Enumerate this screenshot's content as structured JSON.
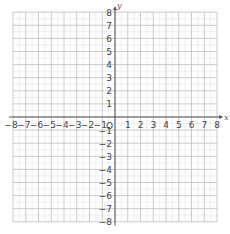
{
  "diagram": {
    "type": "coordinate-plane",
    "x_axis": {
      "label": "x",
      "min": -8,
      "max": 8,
      "tick_labels": [
        "-8",
        "-7",
        "-6",
        "-5",
        "-4",
        "-3",
        "-2",
        "-1",
        "1",
        "2",
        "3",
        "4",
        "5",
        "6",
        "7",
        "8"
      ]
    },
    "y_axis": {
      "label": "y",
      "min": -8,
      "max": 8,
      "tick_labels": [
        "8",
        "7",
        "6",
        "5",
        "4",
        "3",
        "2",
        "1",
        "-1",
        "-2",
        "-3",
        "-4",
        "-5",
        "-6",
        "-7",
        "-8"
      ]
    },
    "origin_label": "O",
    "grid": {
      "major_step": 1,
      "minor_step": 0.5
    },
    "colors": {
      "major_grid": "#bdbdbd",
      "minor_grid": "#e4e4e4",
      "axis": "#555555",
      "label": "#444444"
    }
  }
}
